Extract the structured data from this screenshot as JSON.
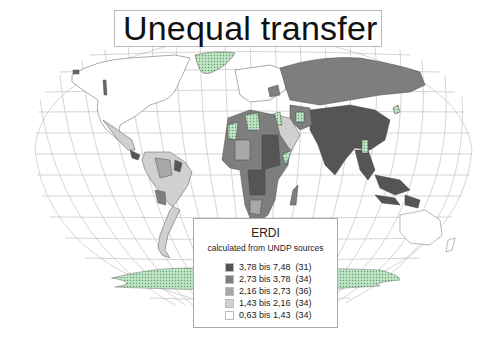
{
  "title": "Unequal transfer",
  "legend": {
    "title": "ERDI",
    "subtitle": "calculated from UNDP sources",
    "items": [
      {
        "range": "3,78 bis 7,48",
        "count": "(31)",
        "color": "#555555"
      },
      {
        "range": "2,73 bis 3,78",
        "count": "(34)",
        "color": "#7e7e7e"
      },
      {
        "range": "2,16 bis 2,73",
        "count": "(36)",
        "color": "#a8a8a8"
      },
      {
        "range": "1,43 bis 2,16",
        "count": "(34)",
        "color": "#d0d0d0"
      },
      {
        "range": "0,63 bis 1,43",
        "count": "(34)",
        "color": "#ffffff"
      }
    ],
    "no_data_pattern_color": "#9fd1a8"
  },
  "map": {
    "projection": "world-curved-graticule",
    "graticule_color": "#b5b5b5"
  }
}
